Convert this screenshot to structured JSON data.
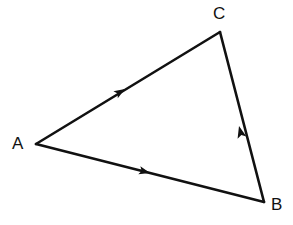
{
  "figure": {
    "type": "vector-triangle-diagram",
    "background_color": "#ffffff",
    "stroke_color": "#111111",
    "stroke_width": 2.6,
    "canvas": {
      "width": 293,
      "height": 225
    },
    "vertices": [
      {
        "id": "A",
        "label": "A",
        "x": 36,
        "y": 144,
        "label_x": 12,
        "label_y": 135
      },
      {
        "id": "B",
        "label": "B",
        "x": 264,
        "y": 202,
        "label_x": 271,
        "label_y": 196
      },
      {
        "id": "C",
        "label": "C",
        "x": 220,
        "y": 32,
        "label_x": 213,
        "label_y": 5
      }
    ],
    "edges": [
      {
        "id": "AC",
        "label": "",
        "from": "A",
        "to": "C",
        "x1": 36,
        "y1": 144,
        "x2": 220,
        "y2": 32,
        "arrow": {
          "x": 125,
          "y": 89,
          "angle_deg": -31.3,
          "size": 11
        }
      },
      {
        "id": "AB",
        "label": "",
        "from": "A",
        "to": "B",
        "x1": 36,
        "y1": 144,
        "x2": 264,
        "y2": 202,
        "arrow": {
          "x": 150,
          "y": 173,
          "angle_deg": 14.3,
          "size": 11
        }
      },
      {
        "id": "BC",
        "label": "",
        "from": "B",
        "to": "C",
        "x1": 264,
        "y1": 202,
        "x2": 220,
        "y2": 32,
        "arrow": {
          "x": 239,
          "y": 126,
          "angle_deg": -104.5,
          "size": 12
        }
      }
    ]
  }
}
